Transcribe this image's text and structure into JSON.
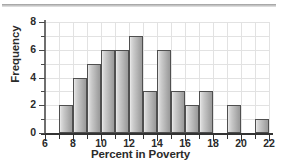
{
  "figure": {
    "name": "poverty-frequency-histogram"
  },
  "axes": {
    "x_title": "Percent in Poverty",
    "y_title": "Frequency",
    "x_major_ticks": [
      6,
      8,
      10,
      12,
      14,
      16,
      18,
      20,
      22
    ],
    "x_major_labels": [
      "6",
      "8",
      "10",
      "12",
      "14",
      "16",
      "18",
      "20",
      "22"
    ],
    "x_minor_ticks": [
      7,
      9,
      11,
      13,
      15,
      17,
      19,
      21
    ],
    "y_major_ticks": [
      0,
      2,
      4,
      6,
      8
    ],
    "y_major_labels": [
      "0",
      "2",
      "4",
      "6",
      "8"
    ],
    "y_minor_ticks": [
      1,
      3,
      5,
      7
    ]
  },
  "colors": {
    "bar_fill_light": "#efefef",
    "bar_fill_dark": "#9b9b9b",
    "bar_edge": "#4f4f4f",
    "gridline": "#e2e2e2",
    "axis": "#333333",
    "text": "#2b2b2b",
    "background": "#ffffff",
    "top_rule": "#9a9a9a"
  },
  "chart_data": {
    "type": "bar",
    "title": "",
    "subtitle": "",
    "xlabel": "Percent in Poverty",
    "ylabel": "Frequency",
    "xlim": [
      6,
      22
    ],
    "ylim": [
      0,
      8
    ],
    "bin_width": 1,
    "grid": true,
    "legend": null,
    "bins": [
      {
        "bin_start": 7,
        "bin_end": 8,
        "label": "7-8",
        "frequency": 2
      },
      {
        "bin_start": 8,
        "bin_end": 9,
        "label": "8-9",
        "frequency": 4
      },
      {
        "bin_start": 9,
        "bin_end": 10,
        "label": "9-10",
        "frequency": 5
      },
      {
        "bin_start": 10,
        "bin_end": 11,
        "label": "10-11",
        "frequency": 6
      },
      {
        "bin_start": 11,
        "bin_end": 12,
        "label": "11-12",
        "frequency": 6
      },
      {
        "bin_start": 12,
        "bin_end": 13,
        "label": "12-13",
        "frequency": 7
      },
      {
        "bin_start": 13,
        "bin_end": 14,
        "label": "13-14",
        "frequency": 3
      },
      {
        "bin_start": 14,
        "bin_end": 15,
        "label": "14-15",
        "frequency": 6
      },
      {
        "bin_start": 15,
        "bin_end": 16,
        "label": "15-16",
        "frequency": 3
      },
      {
        "bin_start": 16,
        "bin_end": 17,
        "label": "16-17",
        "frequency": 2
      },
      {
        "bin_start": 17,
        "bin_end": 18,
        "label": "17-18",
        "frequency": 3
      },
      {
        "bin_start": 18,
        "bin_end": 19,
        "label": "18-19",
        "frequency": 0
      },
      {
        "bin_start": 19,
        "bin_end": 20,
        "label": "19-20",
        "frequency": 2
      },
      {
        "bin_start": 20,
        "bin_end": 21,
        "label": "20-21",
        "frequency": 0
      },
      {
        "bin_start": 21,
        "bin_end": 22,
        "label": "21-22",
        "frequency": 1
      }
    ],
    "categories": [
      "7-8",
      "8-9",
      "9-10",
      "10-11",
      "11-12",
      "12-13",
      "13-14",
      "14-15",
      "15-16",
      "16-17",
      "17-18",
      "18-19",
      "19-20",
      "20-21",
      "21-22"
    ],
    "values": [
      2,
      4,
      5,
      6,
      6,
      7,
      3,
      6,
      3,
      2,
      3,
      0,
      2,
      0,
      1
    ],
    "total_count": 50
  }
}
